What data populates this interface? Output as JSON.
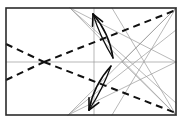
{
  "diagram": {
    "title": "Origami crease pattern with fold arrows",
    "type": "crease-pattern",
    "canvas": {
      "width": 182,
      "height": 123
    },
    "paper": {
      "label": "Square paper boundary",
      "x": 6,
      "y": 8,
      "width": 170,
      "height": 107,
      "stroke": "#2b2b2b",
      "stroke_width": 1.6
    },
    "colors": {
      "border": "#2b2b2b",
      "thin_crease": "#9a9a9a",
      "dashed_crease": "#111111",
      "arrow": "#0d0d0d",
      "background": "#ffffff"
    },
    "reference_points": [
      {
        "name": "top-left-corner",
        "x": 6,
        "y": 8
      },
      {
        "name": "top-right-corner",
        "x": 176,
        "y": 8
      },
      {
        "name": "bottom-left-corner",
        "x": 6,
        "y": 115
      },
      {
        "name": "bottom-right-corner",
        "x": 176,
        "y": 115
      },
      {
        "name": "left-dashed-crossing",
        "x": 44,
        "y": 62
      },
      {
        "name": "center-right-node",
        "x": 122,
        "y": 62
      },
      {
        "name": "top-edge-node",
        "x": 70,
        "y": 8
      },
      {
        "name": "bottom-edge-node",
        "x": 68,
        "y": 115
      },
      {
        "name": "vertical-midline-x",
        "x": 94,
        "y": 62
      }
    ],
    "thin_creases": [
      {
        "name": "thin-horizontal-midline",
        "x1": 6,
        "y1": 62,
        "x2": 176,
        "y2": 62
      },
      {
        "name": "thin-vertical-midline",
        "x1": 94,
        "y1": 8,
        "x2": 94,
        "y2": 115
      },
      {
        "name": "thin-top-node-to-bottom-left-diagonal",
        "x1": 70,
        "y1": 8,
        "x2": 176,
        "y2": 103
      },
      {
        "name": "thin-top-node-to-center-right",
        "x1": 70,
        "y1": 8,
        "x2": 176,
        "y2": 62
      },
      {
        "name": "thin-top-node-to-bottom-right",
        "x1": 70,
        "y1": 8,
        "x2": 176,
        "y2": 115
      },
      {
        "name": "thin-bottom-node-to-top-right",
        "x1": 68,
        "y1": 115,
        "x2": 176,
        "y2": 8
      },
      {
        "name": "thin-bottom-node-to-right-upper",
        "x1": 68,
        "y1": 115,
        "x2": 176,
        "y2": 30
      },
      {
        "name": "thin-bottom-node-to-center-right",
        "x1": 68,
        "y1": 115,
        "x2": 176,
        "y2": 62
      },
      {
        "name": "thin-topright-to-bottom-mid",
        "x1": 176,
        "y1": 8,
        "x2": 112,
        "y2": 115
      },
      {
        "name": "thin-bottomright-to-top-mid",
        "x1": 176,
        "y1": 115,
        "x2": 112,
        "y2": 8
      },
      {
        "name": "thin-right-upper-fan",
        "x1": 122,
        "y1": 62,
        "x2": 176,
        "y2": 8
      },
      {
        "name": "thin-right-lower-fan",
        "x1": 122,
        "y1": 62,
        "x2": 176,
        "y2": 115
      }
    ],
    "dashed_creases": [
      {
        "name": "dashed-upper-left-to-node",
        "x1": 6,
        "y1": 44,
        "x2": 44,
        "y2": 62
      },
      {
        "name": "dashed-lower-left-to-node",
        "x1": 6,
        "y1": 80,
        "x2": 44,
        "y2": 62
      },
      {
        "name": "dashed-node-to-top-right",
        "x1": 44,
        "y1": 62,
        "x2": 176,
        "y2": 10
      },
      {
        "name": "dashed-node-to-bottom-right",
        "x1": 44,
        "y1": 62,
        "x2": 176,
        "y2": 113
      }
    ],
    "arrows": [
      {
        "name": "upper-fold-arrow",
        "direction": "up-left",
        "tip": {
          "x": 93,
          "y": 14
        },
        "tail": {
          "x": 113,
          "y": 58
        },
        "style": "double-curved-valley-fold"
      },
      {
        "name": "lower-fold-arrow",
        "direction": "down-left",
        "tip": {
          "x": 89,
          "y": 110
        },
        "tail": {
          "x": 111,
          "y": 66
        },
        "style": "double-curved-valley-fold"
      }
    ]
  }
}
